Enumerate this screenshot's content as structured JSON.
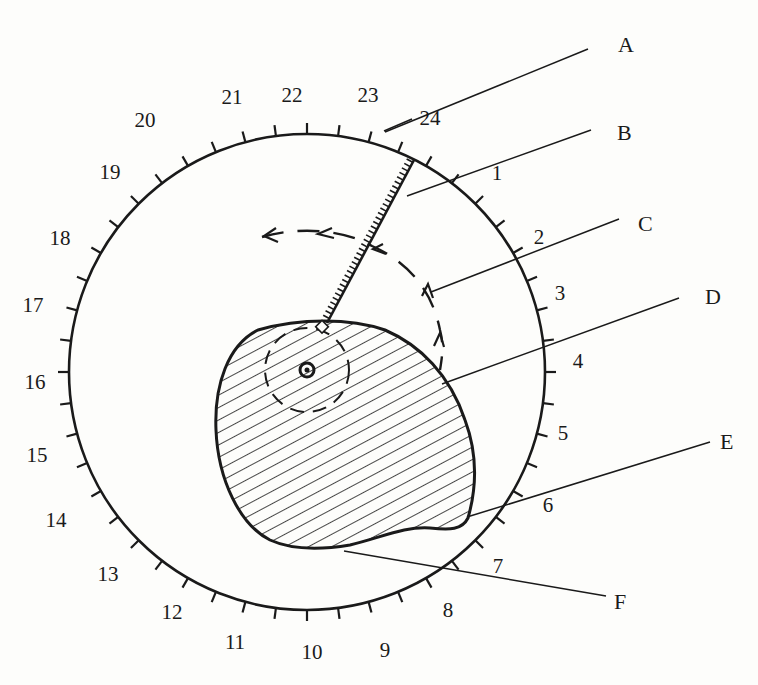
{
  "figure": {
    "title": "",
    "colors": {
      "ink": "#1a1a1a",
      "background": "#fdfdfb"
    }
  },
  "dial": {
    "center": [
      307,
      372
    ],
    "radius": 238,
    "tick_count": 48,
    "hour_labels": [
      {
        "text": "1",
        "x": 497,
        "y": 180
      },
      {
        "text": "2",
        "x": 539,
        "y": 244
      },
      {
        "text": "3",
        "x": 560,
        "y": 300
      },
      {
        "text": "4",
        "x": 578,
        "y": 368
      },
      {
        "text": "5",
        "x": 563,
        "y": 440
      },
      {
        "text": "6",
        "x": 548,
        "y": 512
      },
      {
        "text": "7",
        "x": 498,
        "y": 573
      },
      {
        "text": "8",
        "x": 448,
        "y": 617
      },
      {
        "text": "9",
        "x": 385,
        "y": 657
      },
      {
        "text": "10",
        "x": 312,
        "y": 659
      },
      {
        "text": "11",
        "x": 235,
        "y": 649
      },
      {
        "text": "12",
        "x": 172,
        "y": 619
      },
      {
        "text": "13",
        "x": 108,
        "y": 581
      },
      {
        "text": "14",
        "x": 56,
        "y": 527
      },
      {
        "text": "15",
        "x": 37,
        "y": 462
      },
      {
        "text": "16",
        "x": 35,
        "y": 389
      },
      {
        "text": "17",
        "x": 33,
        "y": 312
      },
      {
        "text": "18",
        "x": 60,
        "y": 245
      },
      {
        "text": "19",
        "x": 110,
        "y": 179
      },
      {
        "text": "20",
        "x": 145,
        "y": 127
      },
      {
        "text": "21",
        "x": 232,
        "y": 104
      },
      {
        "text": "22",
        "x": 292,
        "y": 102
      },
      {
        "text": "23",
        "x": 368,
        "y": 102
      },
      {
        "text": "24",
        "x": 430,
        "y": 125
      }
    ]
  },
  "callouts": [
    {
      "label": "A",
      "x": 618,
      "y": 52,
      "line": [
        385,
        132,
        588,
        49
      ]
    },
    {
      "label": "B",
      "x": 617,
      "y": 140,
      "line": [
        407,
        196,
        591,
        130
      ]
    },
    {
      "label": "C",
      "x": 638,
      "y": 231,
      "line": [
        431,
        292,
        619,
        219
      ]
    },
    {
      "label": "D",
      "x": 705,
      "y": 304,
      "line": [
        442,
        384,
        679,
        298
      ]
    },
    {
      "label": "E",
      "x": 720,
      "y": 449,
      "line": [
        467,
        517,
        710,
        442
      ]
    },
    {
      "label": "F",
      "x": 614,
      "y": 609,
      "line": [
        344,
        551,
        606,
        596
      ]
    }
  ],
  "parts": {
    "rack_arm": {
      "start": [
        327,
        323
      ],
      "end": [
        414,
        160
      ],
      "teeth": 36
    },
    "cam_pivot": {
      "center": [
        307,
        370
      ],
      "outer_r": 7,
      "inner_r": 2.5
    },
    "inner_dashed_circle": {
      "center": [
        307,
        370
      ],
      "r": 42
    }
  }
}
